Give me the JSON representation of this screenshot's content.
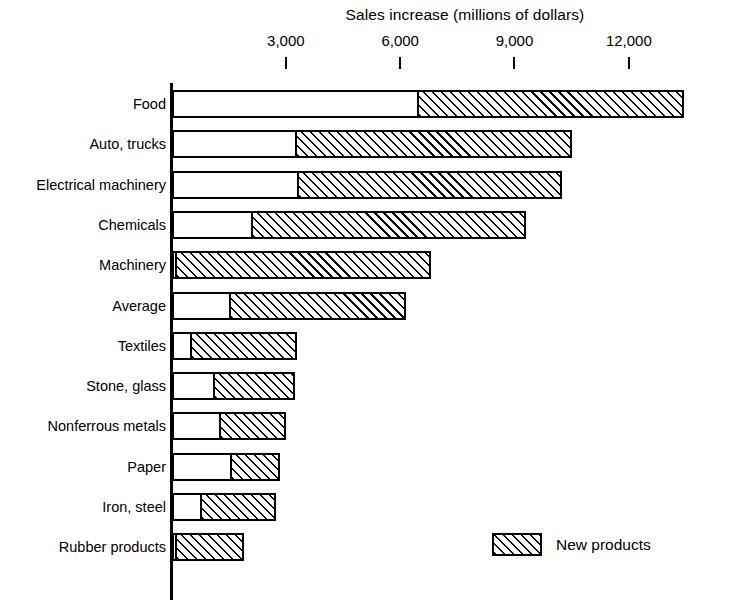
{
  "chart_data": {
    "type": "bar",
    "orientation": "horizontal",
    "stacked": true,
    "title": "Sales increase (millions of dollars)",
    "xlabel": "",
    "ylabel": "",
    "xlim": [
      0,
      14700
    ],
    "xticks": [
      3000,
      6000,
      9000,
      12000
    ],
    "xticklabels": [
      "3,000",
      "6,000",
      "9,000",
      "12,000"
    ],
    "grid": false,
    "legend": {
      "position": "bottom-right",
      "entries": [
        {
          "label": "New products",
          "fill": "diagonal-hatch"
        }
      ]
    },
    "categories": [
      "Food",
      "Auto,  trucks",
      "Electrical machinery",
      "Chemicals",
      "Machinery",
      "Average",
      "Textiles",
      "Stone, glass",
      "Nonferrous metals",
      "Paper",
      "Iron, steel",
      "Rubber products"
    ],
    "series": [
      {
        "name": "Existing products",
        "fill": "solid-white",
        "values": [
          6500,
          3300,
          3350,
          2150,
          150,
          1550,
          550,
          1150,
          1300,
          1600,
          800,
          150
        ]
      },
      {
        "name": "New products",
        "fill": "diagonal-hatch",
        "values": [
          6950,
          7200,
          6900,
          7150,
          6650,
          4600,
          2750,
          2100,
          1700,
          1250,
          1950,
          1750
        ]
      }
    ],
    "totals": [
      13450,
      10500,
      10250,
      9300,
      6800,
      6150,
      3300,
      3250,
      3000,
      2850,
      2750,
      1900
    ]
  },
  "legend": {
    "new_products_label": "New products"
  }
}
